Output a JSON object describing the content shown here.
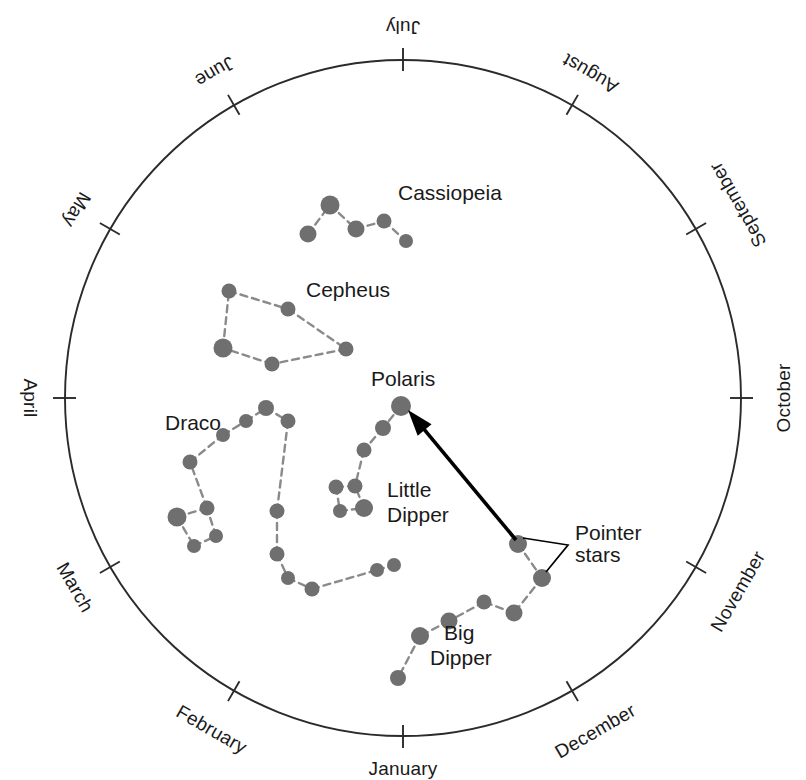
{
  "figure": {
    "kind": "circumpolar-star-chart",
    "background_color": "#ffffff",
    "circle": {
      "cx": 403,
      "cy": 398,
      "r": 338,
      "stroke": "#2b2b2b"
    },
    "star_color": "#6f6f6f",
    "link_color": "#8a8a8a",
    "arrow_color": "#000000"
  },
  "months": [
    {
      "label": "July",
      "angle_deg": 270,
      "rotation_deg": 180,
      "anchor": "middle",
      "label_radius": 372,
      "tick_inner": 327,
      "tick_outer": 350
    },
    {
      "label": "August",
      "angle_deg": 300,
      "rotation_deg": 210,
      "anchor": "middle",
      "label_radius": 376,
      "tick_inner": 327,
      "tick_outer": 350
    },
    {
      "label": "September",
      "angle_deg": 330,
      "rotation_deg": 240,
      "anchor": "middle",
      "label_radius": 388,
      "tick_inner": 327,
      "tick_outer": 350
    },
    {
      "label": "October",
      "angle_deg": 0,
      "rotation_deg": 270,
      "anchor": "middle",
      "label_radius": 382,
      "tick_inner": 327,
      "tick_outer": 350
    },
    {
      "label": "November",
      "angle_deg": 30,
      "rotation_deg": 300,
      "anchor": "middle",
      "label_radius": 388,
      "tick_inner": 327,
      "tick_outer": 350
    },
    {
      "label": "December",
      "angle_deg": 60,
      "rotation_deg": 330,
      "anchor": "middle",
      "label_radius": 386,
      "tick_inner": 327,
      "tick_outer": 350
    },
    {
      "label": "January",
      "angle_deg": 90,
      "rotation_deg": 0,
      "anchor": "middle",
      "label_radius": 372,
      "tick_inner": 327,
      "tick_outer": 350
    },
    {
      "label": "February",
      "angle_deg": 120,
      "rotation_deg": 30,
      "anchor": "middle",
      "label_radius": 384,
      "tick_inner": 327,
      "tick_outer": 350
    },
    {
      "label": "March",
      "angle_deg": 150,
      "rotation_deg": 60,
      "anchor": "middle",
      "label_radius": 380,
      "tick_inner": 327,
      "tick_outer": 350
    },
    {
      "label": "April",
      "angle_deg": 180,
      "rotation_deg": 90,
      "anchor": "middle",
      "label_radius": 374,
      "tick_inner": 327,
      "tick_outer": 350
    },
    {
      "label": "May",
      "angle_deg": 210,
      "rotation_deg": 120,
      "anchor": "middle",
      "label_radius": 378,
      "tick_inner": 327,
      "tick_outer": 350
    },
    {
      "label": "June",
      "angle_deg": 240,
      "rotation_deg": 150,
      "anchor": "middle",
      "label_radius": 378,
      "tick_inner": 327,
      "tick_outer": 350
    }
  ],
  "constellations": [
    {
      "name": "Cassiopeia",
      "label": {
        "text": "Cassiopeia",
        "x": 398,
        "y": 200,
        "anchor": "start"
      },
      "stars": [
        {
          "x": 308,
          "y": 234,
          "r": 8.5
        },
        {
          "x": 330,
          "y": 205,
          "r": 9.5
        },
        {
          "x": 356,
          "y": 229,
          "r": 8.5
        },
        {
          "x": 384,
          "y": 221,
          "r": 7.5
        },
        {
          "x": 406,
          "y": 241,
          "r": 7.0
        }
      ],
      "links": [
        [
          0,
          1
        ],
        [
          1,
          2
        ],
        [
          2,
          3
        ],
        [
          3,
          4
        ]
      ]
    },
    {
      "name": "Cepheus",
      "label": {
        "text": "Cepheus",
        "x": 306,
        "y": 297,
        "anchor": "start"
      },
      "stars": [
        {
          "x": 229,
          "y": 291,
          "r": 7.5
        },
        {
          "x": 288,
          "y": 309,
          "r": 7.5
        },
        {
          "x": 346,
          "y": 349,
          "r": 7.5
        },
        {
          "x": 272,
          "y": 364,
          "r": 7.5
        },
        {
          "x": 223,
          "y": 348,
          "r": 9.5
        }
      ],
      "links": [
        [
          0,
          1
        ],
        [
          1,
          2
        ],
        [
          2,
          3
        ],
        [
          3,
          4
        ],
        [
          4,
          0
        ]
      ]
    },
    {
      "name": "Draco",
      "label": {
        "text": "Draco",
        "x": 165,
        "y": 430,
        "anchor": "start"
      },
      "stars": [
        {
          "x": 177,
          "y": 517,
          "r": 9.5
        },
        {
          "x": 194,
          "y": 546,
          "r": 7.0
        },
        {
          "x": 216,
          "y": 536,
          "r": 7.0
        },
        {
          "x": 207,
          "y": 508,
          "r": 7.5
        },
        {
          "x": 190,
          "y": 462,
          "r": 7.5
        },
        {
          "x": 223,
          "y": 435,
          "r": 7.0
        },
        {
          "x": 246,
          "y": 421,
          "r": 7.0
        },
        {
          "x": 266,
          "y": 408,
          "r": 8.0
        },
        {
          "x": 288,
          "y": 421,
          "r": 7.5
        },
        {
          "x": 277,
          "y": 511,
          "r": 7.5
        },
        {
          "x": 277,
          "y": 554,
          "r": 7.5
        },
        {
          "x": 288,
          "y": 578,
          "r": 7.0
        },
        {
          "x": 312,
          "y": 589,
          "r": 7.5
        },
        {
          "x": 377,
          "y": 570,
          "r": 7.0
        },
        {
          "x": 394,
          "y": 565,
          "r": 7.0
        }
      ],
      "links": [
        [
          0,
          1
        ],
        [
          1,
          2
        ],
        [
          2,
          3
        ],
        [
          3,
          0
        ],
        [
          3,
          4
        ],
        [
          4,
          5
        ],
        [
          5,
          6
        ],
        [
          6,
          7
        ],
        [
          7,
          8
        ],
        [
          8,
          9
        ],
        [
          9,
          10
        ],
        [
          10,
          11
        ],
        [
          11,
          12
        ],
        [
          12,
          13
        ],
        [
          13,
          14
        ]
      ]
    },
    {
      "name": "Little Dipper",
      "label": {
        "text": "Little",
        "x": 387,
        "y": 497,
        "anchor": "start",
        "text2": "Dipper",
        "x2": 387,
        "y2": 522
      },
      "stars": [
        {
          "x": 401,
          "y": 406,
          "r": 10.0
        },
        {
          "x": 383,
          "y": 428,
          "r": 8.0
        },
        {
          "x": 364,
          "y": 450,
          "r": 7.5
        },
        {
          "x": 355,
          "y": 486,
          "r": 7.5
        },
        {
          "x": 336,
          "y": 487,
          "r": 7.5
        },
        {
          "x": 340,
          "y": 511,
          "r": 7.0
        },
        {
          "x": 364,
          "y": 508,
          "r": 9.0
        }
      ],
      "links": [
        [
          0,
          1
        ],
        [
          1,
          2
        ],
        [
          2,
          3
        ],
        [
          3,
          4
        ],
        [
          4,
          5
        ],
        [
          5,
          6
        ],
        [
          6,
          3
        ]
      ]
    },
    {
      "name": "Big Dipper",
      "label": {
        "text": "Big",
        "x": 444,
        "y": 640,
        "anchor": "start",
        "text2": "Dipper",
        "x2": 430,
        "y2": 665
      },
      "stars": [
        {
          "x": 518,
          "y": 544,
          "r": 9.0
        },
        {
          "x": 542,
          "y": 578,
          "r": 9.0
        },
        {
          "x": 514,
          "y": 613,
          "r": 8.5
        },
        {
          "x": 484,
          "y": 602,
          "r": 7.5
        },
        {
          "x": 449,
          "y": 621,
          "r": 8.5
        },
        {
          "x": 420,
          "y": 636,
          "r": 9.0
        },
        {
          "x": 398,
          "y": 678,
          "r": 8.0
        }
      ],
      "links": [
        [
          0,
          1
        ],
        [
          1,
          2
        ],
        [
          2,
          3
        ],
        [
          3,
          4
        ],
        [
          4,
          5
        ],
        [
          5,
          6
        ]
      ]
    }
  ],
  "annotations": {
    "polaris": {
      "text": "Polaris",
      "x": 371,
      "y": 386,
      "anchor": "start"
    },
    "pointer_stars": {
      "text_line1": "Pointer",
      "text_line2": "stars",
      "x": 575,
      "y": 540,
      "y2": 562,
      "leader": {
        "apex_x": 568,
        "apex_y": 545,
        "t1_x": 523,
        "t1_y": 538,
        "t2_x": 546,
        "t2_y": 572
      }
    },
    "arrow": {
      "from_x": 516,
      "from_y": 540,
      "to_x": 408,
      "to_y": 410,
      "label": "arrow-to-polaris"
    }
  }
}
